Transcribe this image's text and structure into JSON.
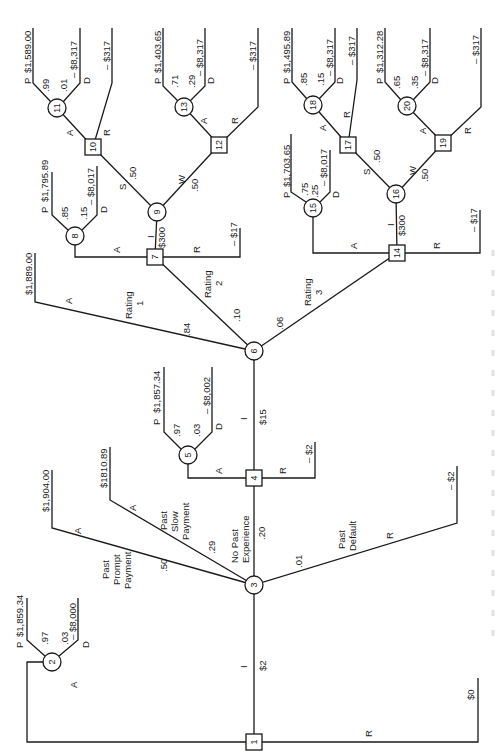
{
  "diagram": {
    "type": "decision-tree",
    "orientation": "rotated-90-ccw",
    "nodes": [
      {
        "id": "1",
        "shape": "decision",
        "x": 254,
        "y": 742
      },
      {
        "id": "2",
        "shape": "chance",
        "x": 52,
        "y": 662
      },
      {
        "id": "3",
        "shape": "chance",
        "x": 254,
        "y": 585
      },
      {
        "id": "4",
        "shape": "decision",
        "x": 254,
        "y": 478
      },
      {
        "id": "5",
        "shape": "chance",
        "x": 188,
        "y": 455
      },
      {
        "id": "6",
        "shape": "chance",
        "x": 254,
        "y": 351
      },
      {
        "id": "7",
        "shape": "decision",
        "x": 155,
        "y": 257
      },
      {
        "id": "8",
        "shape": "chance",
        "x": 75,
        "y": 236
      },
      {
        "id": "9",
        "shape": "chance",
        "x": 157,
        "y": 212
      },
      {
        "id": "10",
        "shape": "decision",
        "x": 93,
        "y": 147
      },
      {
        "id": "11",
        "shape": "chance",
        "x": 57,
        "y": 108
      },
      {
        "id": "12",
        "shape": "decision",
        "x": 219,
        "y": 145
      },
      {
        "id": "13",
        "shape": "chance",
        "x": 184,
        "y": 107
      },
      {
        "id": "14",
        "shape": "decision",
        "x": 397,
        "y": 253
      },
      {
        "id": "15",
        "shape": "chance",
        "x": 313,
        "y": 208
      },
      {
        "id": "16",
        "shape": "chance",
        "x": 396,
        "y": 194
      },
      {
        "id": "17",
        "shape": "decision",
        "x": 348,
        "y": 145
      },
      {
        "id": "18",
        "shape": "chance",
        "x": 313,
        "y": 105
      },
      {
        "id": "19",
        "shape": "decision",
        "x": 443,
        "y": 143
      },
      {
        "id": "20",
        "shape": "chance",
        "x": 407,
        "y": 106
      }
    ],
    "labels": {
      "n1_A": "A",
      "n1_R": "R",
      "n1_I": "I",
      "n1_I_cost": "$2",
      "n1_R_payoff": "$0",
      "n2_P": "P",
      "n2_P_prob": ".97",
      "n2_P_payoff": "$1,859.34",
      "n2_D": "D",
      "n2_D_prob": ".03",
      "n2_D_payoff": "– $8,000",
      "n3_prompt_l1": "Past",
      "n3_prompt_l2": "Prompt",
      "n3_prompt_l3": "Payment",
      "n3_prompt_prob": ".50",
      "n3_prompt_A": "A",
      "n3_prompt_payoff": "$1,904.00",
      "n3_slow_l1": "Past",
      "n3_slow_l2": "Slow",
      "n3_slow_l3": "Payment",
      "n3_slow_prob": ".29",
      "n3_slow_A": "A",
      "n3_slow_payoff": "$1810.89",
      "n3_nopast_l1": "No Past",
      "n3_nopast_l2": "Experience",
      "n3_nopast_prob": ".20",
      "n3_default_l1": "Past",
      "n3_default_l2": "Default",
      "n3_default_prob": ".01",
      "n3_default_R": "R",
      "n3_default_payoff": "– $2",
      "n4_A": "A",
      "n4_R": "R",
      "n4_R_payoff": "– $2",
      "n4_I": "I",
      "n4_I_cost": "$15",
      "n5_P": "P",
      "n5_P_prob": ".97",
      "n5_P_payoff": "$1,857.34",
      "n5_D": "D",
      "n5_D_prob": ".03",
      "n5_D_payoff": "– $8,002",
      "n6_r1_l1": "Rating",
      "n6_r1_l2": "1",
      "n6_r1_prob": ".84",
      "n6_r1_A": "A",
      "n6_r1_payoff": "$1,889.00",
      "n6_r2_l1": "Rating",
      "n6_r2_l2": "2",
      "n6_r2_prob": ".10",
      "n6_r3_l1": "Rating",
      "n6_r3_l2": "3",
      "n6_r3_prob": ".06",
      "n7_A": "A",
      "n7_R": "R",
      "n7_R_payoff": "– $17",
      "n7_I": "I",
      "n7_I_cost": "$300",
      "n8_P": "P",
      "n8_P_prob": ".85",
      "n8_P_payoff": "$1,795.89",
      "n8_D": "D",
      "n8_D_prob": ".15",
      "n8_D_payoff": "– $8,017",
      "n9_S": "S",
      "n9_S_prob": ".50",
      "n9_W": "W",
      "n9_W_prob": ".50",
      "n10_A": "A",
      "n10_R": "R",
      "n10_R_payoff": "– $317",
      "n11_P": "P",
      "n11_P_prob": ".99",
      "n11_P_payoff": "$1,589.00",
      "n11_D": "D",
      "n11_D_prob": ".01",
      "n11_D_payoff": "– $8,317",
      "n12_A": "A",
      "n12_R": "R",
      "n12_R_payoff": "– $317",
      "n13_P": "P",
      "n13_P_prob": ".71",
      "n13_P_payoff": "$1,403.65",
      "n13_D": "D",
      "n13_D_prob": ".29",
      "n13_D_payoff": "– $8,317",
      "n14_A": "A",
      "n14_R": "R",
      "n14_R_payoff": "– $17",
      "n14_I": "I",
      "n14_I_cost": "$300",
      "n15_P": "P",
      "n15_P_prob": ".75",
      "n15_P_payoff": "$1,703.65",
      "n15_D": "D",
      "n15_D_prob": ".25",
      "n15_D_payoff": "– $8,017",
      "n16_S": "S",
      "n16_S_prob": ".50",
      "n16_W": "W",
      "n16_W_prob": ".50",
      "n17_A": "A",
      "n17_R": "R",
      "n17_R_payoff": "– $317",
      "n18_P": "P",
      "n18_P_prob": ".85",
      "n18_P_payoff": "$1,495.89",
      "n18_D": "D",
      "n18_D_prob": ".15",
      "n18_D_payoff": "– $8,317",
      "n19_A": "A",
      "n19_R": "R",
      "n19_R_payoff": "– $317",
      "n20_P": "P",
      "n20_P_prob": ".65",
      "n20_P_payoff": "$1,312.28",
      "n20_D": "D",
      "n20_D_prob": ".35",
      "n20_D_payoff": "– $8,317"
    },
    "colors": {
      "line": "#1a1a1a",
      "background": "#ffffff"
    }
  }
}
